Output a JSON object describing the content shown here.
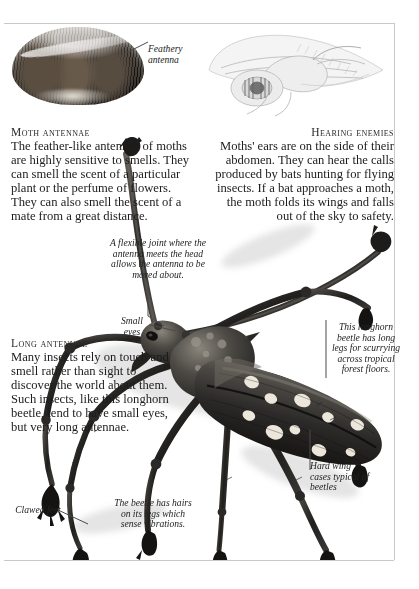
{
  "page": {
    "domain_note": "book-page spread about insect senses",
    "background_color": "#ffffff",
    "rule_color": "#c9c9c9"
  },
  "sections": [
    {
      "id": "moth-antennae",
      "heading": "Moth antennae",
      "body": "The feather-like antennae of moths are highly sensitive to smells. They can smell the scent of a particular plant or the perfume of flowers. They can also smell the scent of a mate from a great distance.",
      "align": "left"
    },
    {
      "id": "hearing-enemies",
      "heading": "Hearing enemies",
      "body": "Moths' ears are on the side of their abdomen. They can hear the calls produced by bats hunting for flying insects. If a bat approaches a moth, the moth folds its wings and falls out of the sky to safety.",
      "align": "right"
    },
    {
      "id": "long-antennae",
      "heading": "Long antennae",
      "body": "Many insects rely on touch and smell rather than sight to discover the world about them. Such insects, like this longhorn beetle, tend to have small eyes, but very long antennae.",
      "align": "left"
    }
  ],
  "captions": [
    {
      "id": "feathery-antenna",
      "text": "Feathery antenna"
    },
    {
      "id": "flexible-joint",
      "text": "A flexible joint where the antenna meets the head allows the antenna to be moved about."
    },
    {
      "id": "small-eyes",
      "text": "Small eyes"
    },
    {
      "id": "longhorn-legs",
      "text": "This longhorn beetle has long legs for scurrying across tropical forest floors."
    },
    {
      "id": "hard-wing-cases",
      "text": "Hard wing cases typical of beetles"
    },
    {
      "id": "clawed-feet",
      "text": "Clawed feet"
    },
    {
      "id": "leg-hairs",
      "text": "The beetle has hairs on its legs which sense vibrations."
    }
  ],
  "figures": [
    {
      "id": "moth-photo",
      "alt": "Close-up photograph of a moth's feathery antennae"
    },
    {
      "id": "moth-drawing",
      "alt": "Pale pencil illustration of a moth showing ear on the abdomen"
    },
    {
      "id": "beetle",
      "alt": "Photograph of a spotted longhorn beetle with very long antennae"
    }
  ]
}
